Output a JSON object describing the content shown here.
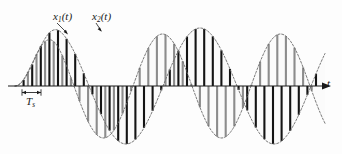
{
  "figure": {
    "axis": {
      "x_label": "t",
      "origin_x": 15,
      "baseline_y": 86,
      "arrow_end_x": 325
    },
    "labels": {
      "signal_1": {
        "base": "x",
        "sub": "1",
        "paren": "(t)"
      },
      "signal_2": {
        "base": "x",
        "sub": "2",
        "paren": "(t)"
      },
      "sample_period": {
        "base": "T",
        "sub": "s",
        "paren": ""
      },
      "time_axis": "t"
    },
    "colors": {
      "curve": "#6d6d6d",
      "sample_bar_primary": "#141414",
      "sample_bar_secondary": "#8c8c8c",
      "axis": "#1a1a1a",
      "background": "#fdfdfd",
      "fill": "#fafafa"
    }
  },
  "chart_data": {
    "type": "line",
    "xlabel": "t",
    "ylabel": "",
    "grid": false,
    "legend": [
      "x1(t)",
      "x2(t)"
    ],
    "legend_position": "inline-annotation",
    "axis_ranges": {
      "x": [
        0,
        342
      ],
      "y_amplitude": 62
    },
    "sample_period_Ts": 8.6,
    "annotations": [
      {
        "text": "x1(t)",
        "target_x": 68,
        "target_y": 34,
        "label_x": 53,
        "label_y": 11
      },
      {
        "text": "x2(t)",
        "target_x": 101,
        "target_y": 31,
        "label_x": 92,
        "label_y": 11
      },
      {
        "text": "Ts",
        "span_x": [
          22,
          41
        ],
        "y": 93
      }
    ],
    "series": [
      {
        "name": "x1(t)",
        "description": "Lower-frequency sinusoid envelope (dashed outline)",
        "period_px": 148,
        "amplitude_px": 58,
        "phase_deg": 0,
        "start_x": 15,
        "end_x": 325
      },
      {
        "name": "x2(t)",
        "description": "Higher-frequency sinusoid envelope (dashed outline)",
        "period_px": 118,
        "amplitude_px": 52,
        "phase_deg": 0,
        "start_x": 15,
        "end_x": 325
      }
    ],
    "samples": {
      "interval_px": 8.6,
      "count": 36,
      "bar_color_series_1": "#141414",
      "bar_color_series_2": "#8c8c8c"
    }
  }
}
